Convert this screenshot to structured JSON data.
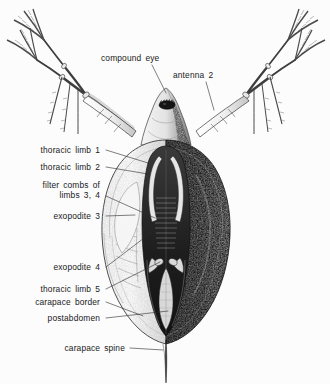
{
  "figure": {
    "background_color": "#fcfcfc",
    "ink_color": "#1a1a1a",
    "labels": [
      {
        "id": "compound-eye",
        "text": "compound eye",
        "x": 101,
        "y": 61,
        "anchor": "start",
        "line": [
          [
            152,
            65
          ],
          [
            166,
            93
          ]
        ]
      },
      {
        "id": "antenna-2",
        "text": "antenna 2",
        "x": 173,
        "y": 78,
        "anchor": "start",
        "line": [
          [
            206,
            82
          ],
          [
            214,
            110
          ]
        ]
      },
      {
        "id": "thoracic-limb-1",
        "text": "thoracic limb 1",
        "x": 100,
        "y": 153,
        "anchor": "end",
        "line": [
          [
            106,
            150
          ],
          [
            148,
            163
          ]
        ]
      },
      {
        "id": "thoracic-limb-2",
        "text": "thoracic limb 2",
        "x": 100,
        "y": 170,
        "anchor": "end",
        "line": [
          [
            106,
            167
          ],
          [
            148,
            174
          ]
        ]
      },
      {
        "id": "filter-combs",
        "text": "filter combs of",
        "x": 100,
        "y": 188,
        "anchor": "end",
        "line": [
          [
            106,
            196
          ],
          [
            155,
            218
          ]
        ]
      },
      {
        "id": "filter-combs-2",
        "text": "limbs 3, 4",
        "x": 100,
        "y": 198,
        "anchor": "end",
        "line": null
      },
      {
        "id": "exopodite-3",
        "text": "exopodite 3",
        "x": 100,
        "y": 219,
        "anchor": "end",
        "line": [
          [
            106,
            216
          ],
          [
            135,
            215
          ]
        ]
      },
      {
        "id": "exopodite-4",
        "text": "exopodite 4",
        "x": 100,
        "y": 270,
        "anchor": "end",
        "line": [
          [
            106,
            267
          ],
          [
            152,
            232
          ]
        ]
      },
      {
        "id": "thoracic-limb-5",
        "text": "thoracic limb 5",
        "x": 100,
        "y": 292,
        "anchor": "end",
        "line": [
          [
            106,
            289
          ],
          [
            160,
            262
          ]
        ]
      },
      {
        "id": "carapace-border",
        "text": "carapace border",
        "x": 100,
        "y": 305,
        "anchor": "end",
        "line": [
          [
            106,
            302
          ],
          [
            143,
            316
          ]
        ]
      },
      {
        "id": "postabdomen",
        "text": "postabdomen",
        "x": 100,
        "y": 321,
        "anchor": "end",
        "line": [
          [
            106,
            318
          ],
          [
            168,
            311
          ]
        ]
      },
      {
        "id": "carapace-spine",
        "text": "carapace spine",
        "x": 125,
        "y": 351,
        "anchor": "end",
        "line": [
          [
            130,
            348
          ],
          [
            163,
            350
          ]
        ]
      }
    ]
  }
}
